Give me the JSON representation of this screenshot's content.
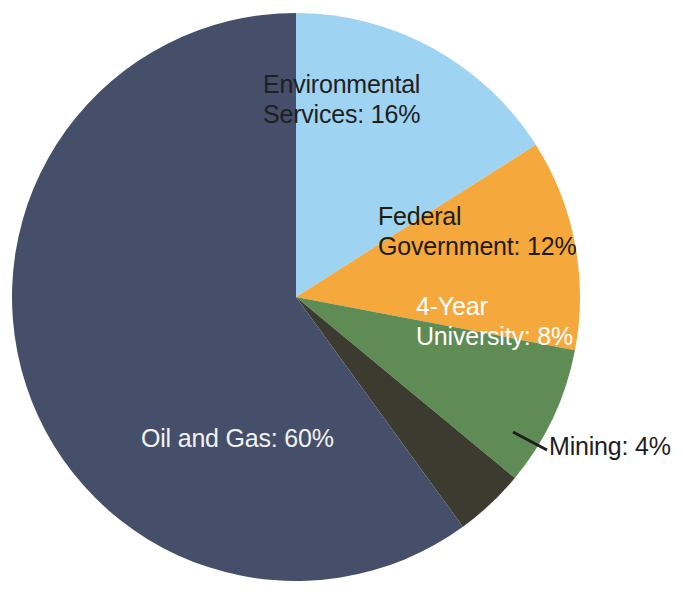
{
  "chart_data": {
    "type": "pie",
    "title": "",
    "subtitle": "",
    "xlabel": "",
    "ylabel": "",
    "legend_position": "none",
    "grid": false,
    "labels_on_slices": true,
    "value_unit": "%",
    "start_angle_deg": 0,
    "direction": "clockwise",
    "categories": [
      "Environmental Services",
      "Federal Government",
      "4-Year University",
      "Mining",
      "Oil and Gas"
    ],
    "values": [
      16,
      12,
      8,
      4,
      60
    ],
    "colors": [
      "#9ED4F1",
      "#F5A93C",
      "#5F8B55",
      "#3B3B30",
      "#464F69"
    ],
    "slices": [
      {
        "name": "Environmental Services",
        "value": 16,
        "label": "Environmental\nServices: 16%",
        "color": "#9ED4F1",
        "text_color": "#1e1e23",
        "label_placement": "inside"
      },
      {
        "name": "Federal Government",
        "value": 12,
        "label": "Federal\nGovernment: 12%",
        "color": "#F5A93C",
        "text_color": "#231a08",
        "label_placement": "inside"
      },
      {
        "name": "4-Year University",
        "value": 8,
        "label": "4-Year\nUniversity: 8%",
        "color": "#5F8B55",
        "text_color": "#ffffff",
        "label_placement": "inside"
      },
      {
        "name": "Mining",
        "value": 4,
        "label": "Mining: 4%",
        "color": "#3B3B30",
        "text_color": "#1e1e1e",
        "label_placement": "outside-with-leader"
      },
      {
        "name": "Oil and Gas",
        "value": 60,
        "label": "Oil and Gas: 60%",
        "color": "#464F69",
        "text_color": "#f2f2f4",
        "label_placement": "inside"
      }
    ],
    "geometry": {
      "center_x": 296,
      "center_y": 297,
      "radius": 284,
      "leader_line_color": "#1e1e1e"
    }
  }
}
